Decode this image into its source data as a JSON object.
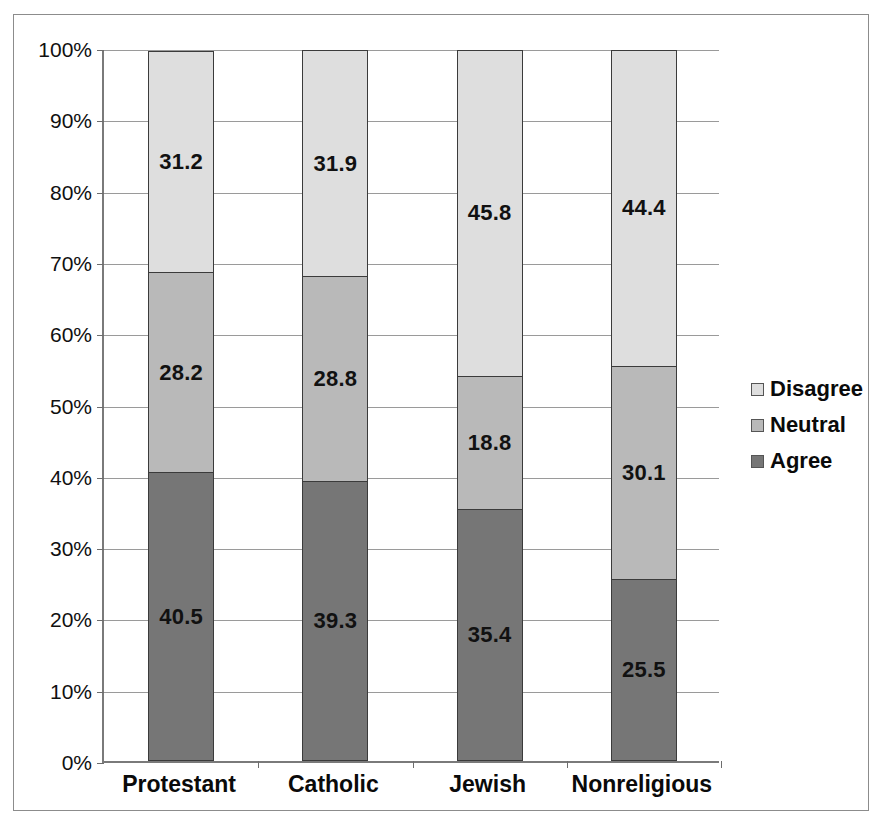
{
  "chart_data": {
    "type": "bar",
    "stacked": true,
    "stack_mode": "percent",
    "title": "",
    "xlabel": "",
    "ylabel": "",
    "ylim": [
      0,
      100
    ],
    "yticks": [
      "0%",
      "10%",
      "20%",
      "30%",
      "40%",
      "50%",
      "60%",
      "70%",
      "80%",
      "90%",
      "100%"
    ],
    "ytick_values": [
      0,
      10,
      20,
      30,
      40,
      50,
      60,
      70,
      80,
      90,
      100
    ],
    "grid": true,
    "legend_position": "right",
    "categories": [
      "Protestant",
      "Catholic",
      "Jewish",
      "Nonreligious"
    ],
    "series": [
      {
        "name": "Agree",
        "color": "#767676",
        "values": [
          40.5,
          39.3,
          35.4,
          25.5
        ],
        "labels": [
          "40.5",
          "39.3",
          "35.4",
          "25.5"
        ]
      },
      {
        "name": "Neutral",
        "color": "#b9b9b9",
        "values": [
          28.2,
          28.8,
          18.8,
          30.1
        ],
        "labels": [
          "28.2",
          "28.8",
          "18.8",
          "30.1"
        ]
      },
      {
        "name": "Disagree",
        "color": "#dedede",
        "values": [
          31.2,
          31.9,
          45.8,
          44.4
        ],
        "labels": [
          "31.2",
          "31.9",
          "45.8",
          "44.4"
        ]
      }
    ]
  },
  "legend": {
    "items": [
      {
        "label": "Disagree",
        "color": "#dedede"
      },
      {
        "label": "Neutral",
        "color": "#b9b9b9"
      },
      {
        "label": "Agree",
        "color": "#767676"
      }
    ]
  },
  "axis": {
    "y": {
      "ticks": [
        {
          "label": "100%",
          "value": 100
        },
        {
          "label": "90%",
          "value": 90
        },
        {
          "label": "80%",
          "value": 80
        },
        {
          "label": "70%",
          "value": 70
        },
        {
          "label": "60%",
          "value": 60
        },
        {
          "label": "50%",
          "value": 50
        },
        {
          "label": "40%",
          "value": 40
        },
        {
          "label": "30%",
          "value": 30
        },
        {
          "label": "20%",
          "value": 20
        },
        {
          "label": "10%",
          "value": 10
        },
        {
          "label": "0%",
          "value": 0
        }
      ]
    },
    "x": {
      "ticks": [
        "Protestant",
        "Catholic",
        "Jewish",
        "Nonreligious"
      ]
    }
  },
  "colors": {
    "disagree": "#dedede",
    "neutral": "#b9b9b9",
    "agree": "#767676",
    "gridline": "#9a9a9a",
    "axis": "#7a7a7a",
    "bar_border": "#3b3b3b",
    "frame": "#8c8c8c",
    "text": "#0a0a0a"
  }
}
